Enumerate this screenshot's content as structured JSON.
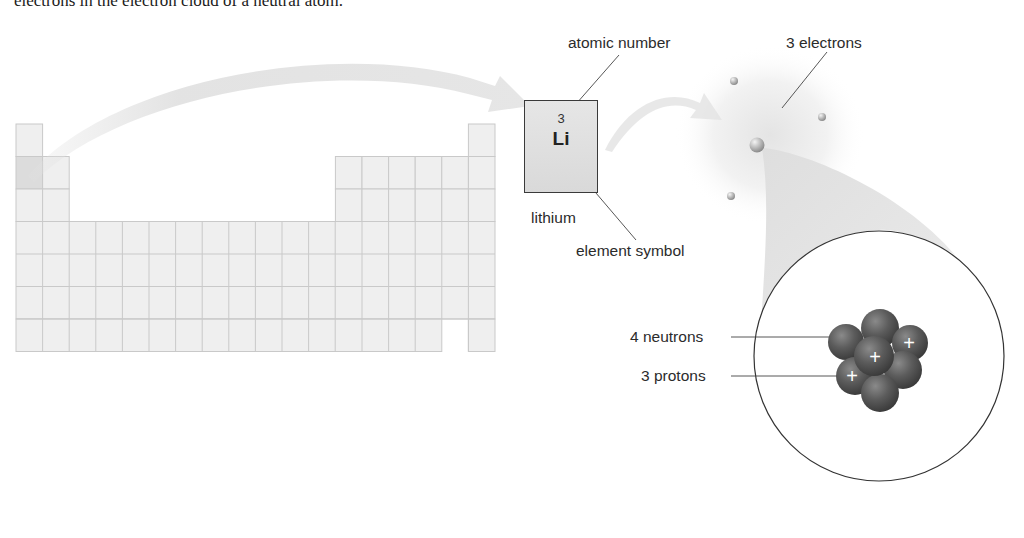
{
  "caption": {
    "text": "electrons in the electron cloud of a neutral atom."
  },
  "periodic_table": {
    "columns": 18,
    "rows": 7,
    "highlighted_cell": {
      "row": 2,
      "column": 1
    }
  },
  "element": {
    "atomic_number": "3",
    "symbol": "Li",
    "name": "lithium"
  },
  "labels": {
    "atomic_number": "atomic number",
    "element_symbol": "element symbol",
    "electrons": "3 electrons",
    "neutrons": "4 neutrons",
    "protons": "3 protons"
  },
  "atom": {
    "electron_count": 3,
    "neutron_count": 4,
    "proton_count": 3,
    "proton_mark": "+"
  },
  "colors": {
    "cell_fill": "#efefef",
    "cell_border": "#c8c8c8",
    "nucleon": "#555555",
    "line": "#333333"
  }
}
